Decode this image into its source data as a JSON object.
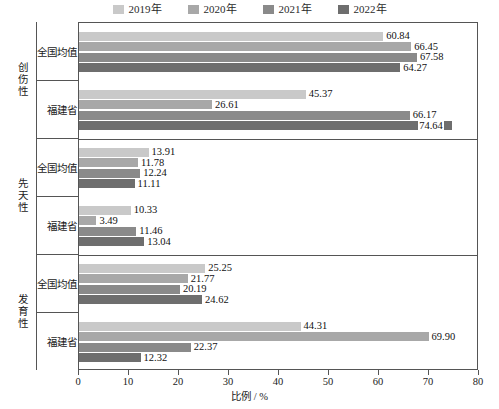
{
  "legend": {
    "position": "top-center",
    "items": [
      {
        "label": "2019年",
        "color": "#c9c9c9"
      },
      {
        "label": "2020年",
        "color": "#a8a8a8"
      },
      {
        "label": "2021年",
        "color": "#8a8a8a"
      },
      {
        "label": "2022年",
        "color": "#6e6e6e"
      }
    ]
  },
  "axis": {
    "x_title": "比例 / %",
    "x_ticks": [
      "0",
      "10",
      "20",
      "30",
      "40",
      "50",
      "60",
      "70",
      "80"
    ]
  },
  "groups": [
    {
      "name": "创伤性",
      "categories": [
        {
          "label": "全国均值",
          "values": [
            "60.84",
            "66.45",
            "67.58",
            "64.27"
          ]
        },
        {
          "label": "福建省",
          "values": [
            "45.37",
            "26.61",
            "66.17",
            "74.64"
          ]
        }
      ]
    },
    {
      "name": "先天性",
      "categories": [
        {
          "label": "全国均值",
          "values": [
            "13.91",
            "11.78",
            "12.24",
            "11.11"
          ]
        },
        {
          "label": "福建省",
          "values": [
            "10.33",
            "3.49",
            "11.46",
            "13.04"
          ]
        }
      ]
    },
    {
      "name": "发育性",
      "categories": [
        {
          "label": "全国均值",
          "values": [
            "25.25",
            "21.77",
            "20.19",
            "24.62"
          ]
        },
        {
          "label": "福建省",
          "values": [
            "44.31",
            "69.90",
            "22.37",
            "12.32"
          ]
        }
      ]
    }
  ],
  "chart_data": {
    "type": "bar",
    "orientation": "horizontal",
    "title": "",
    "xlabel": "比例 / %",
    "ylabel": "",
    "xlim": [
      0,
      80
    ],
    "xticks": [
      0,
      10,
      20,
      30,
      40,
      50,
      60,
      70,
      80
    ],
    "grid": false,
    "legend_position": "top-center",
    "legend": [
      "2019年",
      "2020年",
      "2021年",
      "2022年"
    ],
    "group_labels": [
      "创伤性",
      "先天性",
      "发育性"
    ],
    "categories": [
      "创伤性 / 全国均值",
      "创伤性 / 福建省",
      "先天性 / 全国均值",
      "先天性 / 福建省",
      "发育性 / 全国均值",
      "发育性 / 福建省"
    ],
    "series": [
      {
        "name": "2019年",
        "color": "#c9c9c9",
        "values": [
          60.84,
          45.37,
          13.91,
          10.33,
          25.25,
          44.31
        ]
      },
      {
        "name": "2020年",
        "color": "#a8a8a8",
        "values": [
          66.45,
          26.61,
          11.78,
          3.49,
          21.77,
          69.9
        ]
      },
      {
        "name": "2021年",
        "color": "#8a8a8a",
        "values": [
          67.58,
          66.17,
          12.24,
          11.46,
          20.19,
          22.37
        ]
      },
      {
        "name": "2022年",
        "color": "#6e6e6e",
        "values": [
          64.27,
          74.64,
          11.11,
          13.04,
          24.62,
          12.32
        ]
      }
    ]
  }
}
